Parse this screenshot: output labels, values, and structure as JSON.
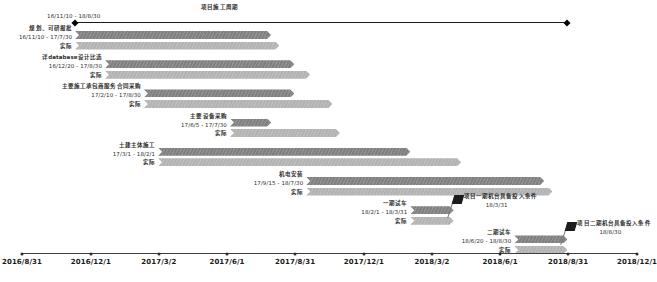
{
  "chart_data": {
    "type": "bar",
    "subtype": "gantt",
    "title": "项目施工周期",
    "xlabel": "",
    "ylabel": "",
    "grid": false,
    "legend": "none",
    "axis": {
      "start": "2016/8/31",
      "end": "2018/12/1",
      "ticks": [
        "2016/8/31",
        "2016/12/1",
        "2017/3/2",
        "2017/6/1",
        "2017/8/31",
        "2017/12/1",
        "2018/3/2",
        "2018/6/1",
        "2018/8/31",
        "2018/12/1"
      ]
    },
    "project": {
      "label": "项目施工周期",
      "range": "16/11/10 - 18/8/30",
      "start": "16/11/10",
      "end": "18/8/30"
    },
    "actual_label": "实际",
    "tasks": [
      {
        "name": "规划、可研报批",
        "range": "16/11/10 - 17/7/30",
        "plan_start": "16/11/10",
        "plan_end": "17/7/30",
        "actual_label": "实际",
        "actual_start": "16/11/10",
        "actual_end": "17/8/10"
      },
      {
        "name": "详database设计比选",
        "range": "16/12/20 - 17/8/30",
        "plan_start": "16/12/20",
        "plan_end": "17/8/30",
        "actual_label": "实际",
        "actual_start": "16/12/20",
        "actual_end": "17/9/20"
      },
      {
        "name": "主要施工承包商服务合同采购",
        "range": "17/2/10 - 17/8/30",
        "plan_start": "17/2/10",
        "plan_end": "17/8/30",
        "actual_label": "实际",
        "actual_start": "17/2/10",
        "actual_end": "17/10/20"
      },
      {
        "name": "主要设备采购",
        "range": "17/6/5 - 17/7/30",
        "plan_start": "17/6/5",
        "plan_end": "17/7/30",
        "actual_label": "实际",
        "actual_start": "17/6/5",
        "actual_end": "17/10/30"
      },
      {
        "name": "土建主体施工",
        "range": "17/3/1 - 18/2/1",
        "plan_start": "17/3/1",
        "plan_end": "18/2/1",
        "actual_label": "实际",
        "actual_start": "17/3/1",
        "actual_end": "18/4/10"
      },
      {
        "name": "机电安装",
        "range": "17/9/15 - 18/7/30",
        "plan_start": "17/9/15",
        "plan_end": "18/7/30",
        "actual_label": "实际",
        "actual_start": "17/9/15",
        "actual_end": "18/8/10"
      },
      {
        "name": "一期试车",
        "range": "18/2/1 - 18/3/31",
        "plan_start": "18/2/1",
        "plan_end": "18/3/31",
        "actual_label": "实际",
        "actual_start": "18/2/1",
        "actual_end": "18/3/31"
      },
      {
        "name": "二期试车",
        "range": "18/6/20 - 18/8/30",
        "plan_start": "18/6/20",
        "plan_end": "18/8/30",
        "actual_label": "实际",
        "actual_start": "18/6/20",
        "actual_end": "18/8/30"
      }
    ],
    "milestones": [
      {
        "name": "项目一期机台具备投入条件",
        "date": "18/3/31"
      },
      {
        "name": "项目二期机台具备投入条件",
        "date": "18/8/30"
      }
    ],
    "colors": {
      "plan_bar": "#808080",
      "actual_bar": "#b3b3b3",
      "axis": "#3d3d3d",
      "text": "#2b2b2b",
      "milestone": "#1c1c1c"
    }
  }
}
